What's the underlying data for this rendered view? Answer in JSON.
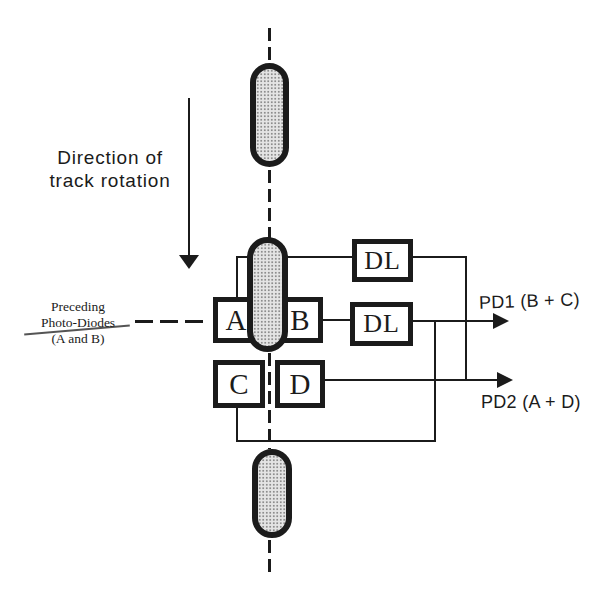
{
  "colors": {
    "ink": "#1b1b1b",
    "paper": "#ffffff",
    "spot_fill": "#e4e4e4",
    "spot_dot": "#8d8d8d"
  },
  "direction_label": {
    "line1": "Direction of",
    "line2": "track rotation"
  },
  "preceding_label": {
    "line1": "Preceding",
    "line2": "Photo-Diodes",
    "line3": "(A and B)"
  },
  "photodiodes": {
    "a": "A",
    "b": "B",
    "c": "C",
    "d": "D"
  },
  "delay_lines": {
    "dl1": "DL",
    "dl2": "DL"
  },
  "outputs": {
    "pd1": "PD1 (B + C)",
    "pd2": "PD2 (A + D)"
  }
}
